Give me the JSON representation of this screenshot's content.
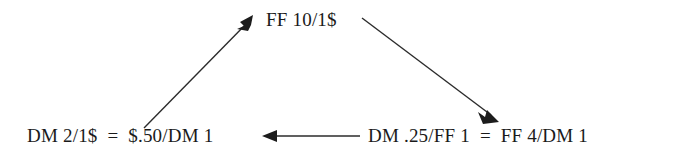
{
  "diagram": {
    "type": "currency-cross-rate-triangle",
    "background_color": "#ffffff",
    "stroke_color": "#262626",
    "text_color": "#1a1a1a",
    "nodes": [
      {
        "id": "top",
        "label": "FF 10/1$",
        "position": "top-center"
      },
      {
        "id": "bottom-left",
        "label": "DM 2/1$  =  $.50/DM 1",
        "position": "bottom-left"
      },
      {
        "id": "bottom-right",
        "label": "DM .25/FF 1  =  FF 4/DM 1",
        "position": "bottom-right"
      }
    ],
    "arrows": [
      {
        "id": "bottom-left-to-top",
        "from": "bottom-left",
        "to": "top",
        "direction": "up-right",
        "head_at": "top"
      },
      {
        "id": "top-to-bottom-right",
        "from": "top",
        "to": "bottom-right",
        "direction": "down-right",
        "head_at": "bottom-right"
      },
      {
        "id": "bottom-right-to-bottom-left",
        "from": "bottom-right",
        "to": "bottom-left",
        "direction": "left",
        "head_at": "bottom-left"
      }
    ]
  }
}
